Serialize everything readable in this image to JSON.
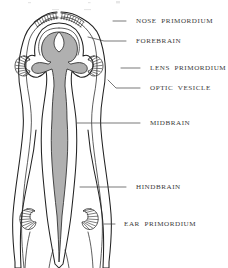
{
  "figure": {
    "kind": "anatomical-diagram",
    "background_color": "#ffffff",
    "neural_tube_fill": "#b0b0b0",
    "tissue_fill": "#ffffff",
    "outline_color": "#222222",
    "label_color": "#3a3a3a",
    "leader_color": "#3f3f3f"
  },
  "labels": [
    {
      "id": "nose-primordium",
      "text": "NOSE  PRIMORDIUM",
      "text_x": 136,
      "text_y": 21,
      "leader": "M 126 21 L 113 21",
      "target": "dorsal anterior hatched crest"
    },
    {
      "id": "forebrain",
      "text": "FOREBRAIN",
      "text_x": 136,
      "text_y": 41,
      "leader": "M 126 41 L 104 41 L 88 37",
      "target": "anterior neural tube lumen"
    },
    {
      "id": "lens-primordium",
      "text": "LENS  PRIMORDIUM",
      "text_x": 150,
      "text_y": 68,
      "leader": "M 140 68 L 121 68",
      "target": "right lateral hatched placode"
    },
    {
      "id": "optic-vesicle",
      "text": "OPTIC  VESICLE",
      "text_x": 150,
      "text_y": 88,
      "leader": "M 140 88 L 116 88 L 108 80",
      "target": "lateral outpocketing"
    },
    {
      "id": "midbrain",
      "text": "MIDBRAIN",
      "text_x": 150,
      "text_y": 123,
      "leader": "M 140 123 L 97 123 L 77 123",
      "target": "mid neural tube"
    },
    {
      "id": "hindbrain",
      "text": "HINDBRAIN",
      "text_x": 136,
      "text_y": 187,
      "leader": "M 126 187 L 80 187",
      "target": "posterior neural tube"
    },
    {
      "id": "ear-primordium",
      "text": "EAR  PRIMORDIUM",
      "text_x": 124,
      "text_y": 224,
      "leader": "M 115 224 L 104 224",
      "target": "posterior lateral hatched otic placode"
    }
  ]
}
